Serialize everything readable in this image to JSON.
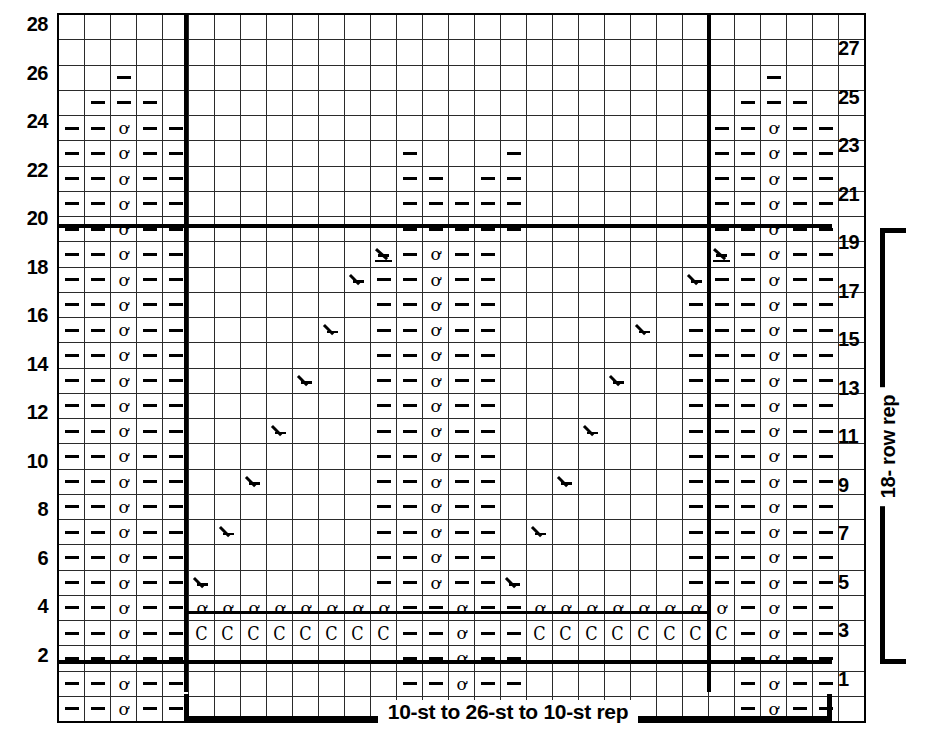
{
  "chart": {
    "columns": 31,
    "rows": 28,
    "cell_width_px": 25,
    "cell_height_px": 24,
    "colors": {
      "knit_on_rs": "#8d8d8d",
      "background": "#ffffff",
      "grid_line": "#2b2b2b",
      "heavy_line": "#000000"
    },
    "symbols": {
      "blank_gray": "gray-no-stitch-cell",
      "blank_white": "empty-white-cell",
      "dash": "purl-dash-symbol",
      "q": "bobble-twisted-stitch-symbol",
      "c": "crescent-yarn-over-symbol",
      "dec": "decrease-symbol",
      "cdd": "centered-double-decrease-symbol"
    },
    "left_row_numbers": [
      28,
      26,
      24,
      22,
      20,
      18,
      16,
      14,
      12,
      10,
      8,
      6,
      4,
      2
    ],
    "right_row_numbers": [
      27,
      25,
      23,
      21,
      19,
      17,
      15,
      13,
      11,
      9,
      7,
      5,
      3,
      1
    ],
    "stitch_repeat_label": "10-st to 26-st to 10-st rep",
    "row_repeat_label": "18- row rep",
    "grid": [
      [
        "w",
        "w",
        "w",
        "w",
        "w",
        "g",
        "g",
        "g",
        "g",
        "g",
        "g",
        "g",
        "g",
        "w",
        "w",
        "w",
        "w",
        "w",
        "g",
        "g",
        "g",
        "g",
        "g",
        "g",
        "g",
        "w",
        "w",
        "w",
        "w",
        "w",
        "w"
      ],
      [
        "w",
        "w",
        "w",
        "w",
        "w",
        "g",
        "g",
        "g",
        "g",
        "g",
        "g",
        "g",
        "g",
        "w",
        "w",
        "w",
        "w",
        "w",
        "g",
        "g",
        "g",
        "g",
        "g",
        "g",
        "g",
        "w",
        "w",
        "w",
        "w",
        "w",
        "w"
      ],
      [
        "w",
        "w",
        "w-dash",
        "w",
        "w",
        "g",
        "g",
        "g",
        "g",
        "g",
        "g",
        "g",
        "g",
        "w",
        "w",
        "w",
        "w",
        "w",
        "g",
        "g",
        "g",
        "g",
        "g",
        "g",
        "g",
        "w",
        "w",
        "w-dash",
        "w",
        "w",
        "w"
      ],
      [
        "w",
        "w-dash",
        "w-dash",
        "w-dash",
        "w",
        "g",
        "g",
        "g",
        "g",
        "g",
        "g",
        "g",
        "g",
        "w",
        "w",
        "w",
        "w",
        "w",
        "g",
        "g",
        "g",
        "g",
        "g",
        "g",
        "g",
        "w",
        "w-dash",
        "w-dash",
        "w-dash",
        "w",
        "w"
      ],
      [
        "w-dash",
        "w-dash",
        "w-q",
        "w-dash",
        "w-dash",
        "g",
        "g",
        "g",
        "g",
        "g",
        "g",
        "g",
        "g",
        "w",
        "w",
        "w",
        "w",
        "w",
        "g",
        "g",
        "g",
        "g",
        "g",
        "g",
        "g",
        "w-dash",
        "w-dash",
        "w-q",
        "w-dash",
        "w-dash",
        "w"
      ],
      [
        "w-dash",
        "w-dash",
        "w-q",
        "w-dash",
        "w-dash",
        "g",
        "g",
        "g",
        "g",
        "g",
        "g",
        "g",
        "g",
        "w-dash",
        "w",
        "w",
        "w",
        "w-dash",
        "g",
        "g",
        "g",
        "g",
        "g",
        "g",
        "g",
        "w-dash",
        "w-dash",
        "w-q",
        "w-dash",
        "w-dash",
        "w"
      ],
      [
        "w-dash",
        "w-dash",
        "w-q",
        "w-dash",
        "w-dash",
        "g",
        "g",
        "g",
        "g",
        "g",
        "g",
        "g",
        "g",
        "w-dash",
        "w-dash",
        "w",
        "w-dash",
        "w-dash",
        "g",
        "g",
        "g",
        "g",
        "g",
        "g",
        "g",
        "w-dash",
        "w-dash",
        "w-q",
        "w-dash",
        "w-dash",
        "w"
      ],
      [
        "w-dash",
        "w-dash",
        "w-q",
        "w-dash",
        "w-dash",
        "g",
        "g",
        "g",
        "g",
        "g",
        "g",
        "g",
        "g",
        "w-dash",
        "w-dash",
        "w-dash",
        "w-dash",
        "w-dash",
        "g",
        "g",
        "g",
        "g",
        "g",
        "g",
        "g",
        "w-dash",
        "w-dash",
        "w-q",
        "w-dash",
        "w-dash",
        "w"
      ],
      [
        "w-dash",
        "w-dash",
        "w-q",
        "w-dash",
        "w-dash",
        "g",
        "g",
        "g",
        "g",
        "g",
        "g",
        "g",
        "g",
        "w-dash",
        "w-dash",
        "w-dash",
        "w-dash",
        "w-dash",
        "g",
        "g",
        "g",
        "g",
        "g",
        "g",
        "g",
        "w-dash",
        "w-dash",
        "w-q",
        "w-dash",
        "w-dash",
        "w"
      ],
      [
        "w-dash",
        "w-dash",
        "w-q",
        "w-dash",
        "w-dash",
        "g",
        "g",
        "g",
        "g",
        "g",
        "g",
        "g",
        "w-cdd",
        "w-dash",
        "w-q",
        "w-dash",
        "w-dash",
        "g",
        "g",
        "g",
        "g",
        "g",
        "g",
        "g",
        "g",
        "w-cdd",
        "w-dash",
        "w-q",
        "w-dash",
        "w-dash",
        "w"
      ],
      [
        "w-dash",
        "w-dash",
        "w-q",
        "w-dash",
        "w-dash",
        "g",
        "g",
        "g",
        "g",
        "g",
        "g",
        "w-dec",
        "w-dash",
        "w-dash",
        "w-q",
        "w-dash",
        "w-dash",
        "g",
        "g",
        "g",
        "g",
        "g",
        "g",
        "g",
        "w-dec",
        "w-dash",
        "w-dash",
        "w-q",
        "w-dash",
        "w-dash",
        "w"
      ],
      [
        "w-dash",
        "w-dash",
        "w-q",
        "w-dash",
        "w-dash",
        "g",
        "g",
        "g",
        "g",
        "g",
        "g",
        "w",
        "w-dash",
        "w-dash",
        "w-q",
        "w-dash",
        "w-dash",
        "g",
        "g",
        "g",
        "g",
        "g",
        "g",
        "w",
        "w-dash",
        "w-dash",
        "w-dash",
        "w-q",
        "w-dash",
        "w-dash",
        "w"
      ],
      [
        "w-dash",
        "w-dash",
        "w-q",
        "w-dash",
        "w-dash",
        "g",
        "g",
        "g",
        "g",
        "g",
        "w-dec",
        "w",
        "w-dash",
        "w-dash",
        "w-q",
        "w-dash",
        "w-dash",
        "g",
        "g",
        "g",
        "g",
        "g",
        "w-dec",
        "w",
        "w-dash",
        "w-dash",
        "w-dash",
        "w-q",
        "w-dash",
        "w-dash",
        "w"
      ],
      [
        "w-dash",
        "w-dash",
        "w-q",
        "w-dash",
        "w-dash",
        "g",
        "g",
        "g",
        "g",
        "g",
        "w",
        "w",
        "w-dash",
        "w-dash",
        "w-q",
        "w-dash",
        "w-dash",
        "g",
        "g",
        "g",
        "g",
        "g",
        "w",
        "w",
        "w-dash",
        "w-dash",
        "w-dash",
        "w-q",
        "w-dash",
        "w-dash",
        "w"
      ],
      [
        "w-dash",
        "w-dash",
        "w-q",
        "w-dash",
        "w-dash",
        "g",
        "g",
        "g",
        "g",
        "w-dec",
        "w",
        "w",
        "w-dash",
        "w-dash",
        "w-q",
        "w-dash",
        "w-dash",
        "g",
        "g",
        "g",
        "g",
        "w-dec",
        "w",
        "w",
        "w-dash",
        "w-dash",
        "w-dash",
        "w-q",
        "w-dash",
        "w-dash",
        "w"
      ],
      [
        "w-dash",
        "w-dash",
        "w-q",
        "w-dash",
        "w-dash",
        "g",
        "g",
        "g",
        "g",
        "w",
        "w",
        "w",
        "w-dash",
        "w-dash",
        "w-q",
        "w-dash",
        "w-dash",
        "g",
        "g",
        "g",
        "g",
        "w",
        "w",
        "w",
        "w-dash",
        "w-dash",
        "w-dash",
        "w-q",
        "w-dash",
        "w-dash",
        "w"
      ],
      [
        "w-dash",
        "w-dash",
        "w-q",
        "w-dash",
        "w-dash",
        "g",
        "g",
        "g",
        "w-dec",
        "w",
        "w",
        "w",
        "w-dash",
        "w-dash",
        "w-q",
        "w-dash",
        "w-dash",
        "g",
        "g",
        "g",
        "w-dec",
        "w",
        "w",
        "w",
        "w-dash",
        "w-dash",
        "w-dash",
        "w-q",
        "w-dash",
        "w-dash",
        "w"
      ],
      [
        "w-dash",
        "w-dash",
        "w-q",
        "w-dash",
        "w-dash",
        "g",
        "g",
        "g",
        "w",
        "w",
        "w",
        "w",
        "w-dash",
        "w-dash",
        "w-q",
        "w-dash",
        "w-dash",
        "g",
        "g",
        "g",
        "w",
        "w",
        "w",
        "w",
        "w-dash",
        "w-dash",
        "w-dash",
        "w-q",
        "w-dash",
        "w-dash",
        "w"
      ],
      [
        "w-dash",
        "w-dash",
        "w-q",
        "w-dash",
        "w-dash",
        "g",
        "g",
        "w-dec",
        "w",
        "w",
        "w",
        "w",
        "w-dash",
        "w-dash",
        "w-q",
        "w-dash",
        "w-dash",
        "g",
        "g",
        "w-dec",
        "w",
        "w",
        "w",
        "w",
        "w-dash",
        "w-dash",
        "w-dash",
        "w-q",
        "w-dash",
        "w-dash",
        "w"
      ],
      [
        "w-dash",
        "w-dash",
        "w-q",
        "w-dash",
        "w-dash",
        "g",
        "g",
        "w",
        "w",
        "w",
        "w",
        "w",
        "w-dash",
        "w-dash",
        "w-q",
        "w-dash",
        "w-dash",
        "g",
        "g",
        "w",
        "w",
        "w",
        "w",
        "w",
        "w-dash",
        "w-dash",
        "w-dash",
        "w-q",
        "w-dash",
        "w-dash",
        "w"
      ],
      [
        "w-dash",
        "w-dash",
        "w-q",
        "w-dash",
        "w-dash",
        "g",
        "w-dec",
        "w",
        "w",
        "w",
        "w",
        "w",
        "w-dash",
        "w-dash",
        "w-q",
        "w-dash",
        "w-dash",
        "g",
        "w-dec",
        "w",
        "w",
        "w",
        "w",
        "w",
        "w-dash",
        "w-dash",
        "w-dash",
        "w-q",
        "w-dash",
        "w-dash",
        "w"
      ],
      [
        "w-dash",
        "w-dash",
        "w-q",
        "w-dash",
        "w-dash",
        "g",
        "w",
        "w",
        "w",
        "w",
        "w",
        "w",
        "w-dash",
        "w-dash",
        "w-q",
        "w-dash",
        "w-dash",
        "g",
        "w",
        "w",
        "w",
        "w",
        "w",
        "w",
        "w-dash",
        "w-dash",
        "w-dash",
        "w-q",
        "w-dash",
        "w-dash",
        "w"
      ],
      [
        "w-dash",
        "w-dash",
        "w-q",
        "w-dash",
        "w-dash",
        "w-dec",
        "w",
        "w",
        "w",
        "w",
        "w",
        "w",
        "w-dash",
        "w-dash",
        "w-q",
        "w-dash",
        "w-dash",
        "w-dec",
        "w",
        "w",
        "w",
        "w",
        "w",
        "w",
        "w-dash",
        "w-dash",
        "w-dash",
        "w-q",
        "w-dash",
        "w-dash",
        "w"
      ],
      [
        "w-dash",
        "w-dash",
        "w-q",
        "w-dash",
        "w-dash",
        "w-q",
        "w-q",
        "w-q",
        "w-q",
        "w-q",
        "w-q",
        "w-q",
        "w-q",
        "w-dash",
        "w-dash",
        "w-q",
        "w-dash",
        "w-dash",
        "w-q",
        "w-q",
        "w-q",
        "w-q",
        "w-q",
        "w-q",
        "w-q",
        "w-q",
        "w-dash",
        "w-q",
        "w-dash",
        "w-dash",
        "w"
      ],
      [
        "w-dash",
        "w-dash",
        "w-q",
        "w-dash",
        "w-dash",
        "w-c",
        "w-c",
        "w-c",
        "w-c",
        "w-c",
        "w-c",
        "w-c",
        "w-c",
        "w-dash",
        "w-dash",
        "w-q",
        "w-dash",
        "w-dash",
        "w-c",
        "w-c",
        "w-c",
        "w-c",
        "w-c",
        "w-c",
        "w-c",
        "w-c",
        "w-dash",
        "w-q",
        "w-dash",
        "w-dash",
        "w"
      ],
      [
        "w-dash",
        "w-dash",
        "w-q",
        "w-dash",
        "w-dash",
        "g",
        "g",
        "g",
        "g",
        "g",
        "g",
        "g",
        "g",
        "w-dash",
        "w-dash",
        "w-q",
        "w-dash",
        "w-dash",
        "g",
        "g",
        "g",
        "g",
        "g",
        "g",
        "g",
        "g",
        "w-dash",
        "w-q",
        "w-dash",
        "w-dash",
        "w"
      ],
      [
        "w-dash",
        "w-dash",
        "w-q",
        "w-dash",
        "w-dash",
        "g",
        "g",
        "g",
        "g",
        "g",
        "g",
        "g",
        "g",
        "w-dash",
        "w-dash",
        "w-q",
        "w-dash",
        "w-dash",
        "g",
        "g",
        "g",
        "g",
        "g",
        "g",
        "g",
        "g",
        "w-dash",
        "w-q",
        "w-dash",
        "w-dash",
        "w"
      ],
      [
        "w-dash",
        "w-dash",
        "w-q",
        "w-dash",
        "w-dash",
        "g",
        "g",
        "g",
        "g",
        "g",
        "g",
        "g",
        "g",
        "w-dash",
        "w-dash",
        "w-q",
        "w-dash",
        "w-dash",
        "g",
        "g",
        "g",
        "g",
        "g",
        "g",
        "g",
        "g",
        "w-dash",
        "w-q",
        "w-dash",
        "w-dash",
        "w"
      ]
    ]
  }
}
